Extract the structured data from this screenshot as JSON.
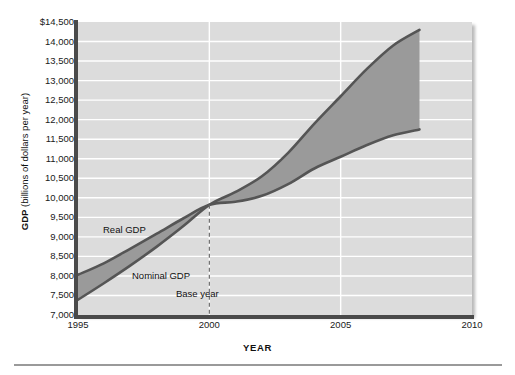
{
  "chart_data": {
    "type": "area",
    "title": "",
    "xlabel": "YEAR",
    "ylabel_bold": "GDP",
    "ylabel_rest": " (billions of dollars per year)",
    "xlim": [
      1995,
      2010
    ],
    "ylim": [
      7000,
      14500
    ],
    "grid": true,
    "legend_position": "inline-annotations",
    "xticks": [
      1995,
      2000,
      2005,
      2010
    ],
    "xtick_labels": [
      "1995",
      "2000",
      "2005",
      "2010"
    ],
    "yticks": [
      7000,
      7500,
      8000,
      8500,
      9000,
      9500,
      10000,
      10500,
      11000,
      11500,
      12000,
      12500,
      13000,
      13500,
      14000,
      14500
    ],
    "ytick_labels": [
      "7,000",
      "7,500",
      "8,000",
      "8,500",
      "9,000",
      "9,500",
      "10,000",
      "10,500",
      "11,000",
      "11,500",
      "12,000",
      "12,500",
      "13,000",
      "13,500",
      "14,000",
      "$14,500"
    ],
    "base_year": 2000,
    "base_year_label": "Base year",
    "x": [
      1995,
      1996,
      1997,
      1998,
      1999,
      2000,
      2001,
      2002,
      2003,
      2004,
      2005,
      2006,
      2007,
      2008
    ],
    "series": [
      {
        "name": "Real GDP",
        "label": "Real GDP",
        "color": "#9a9a9a",
        "line_color": "#555555",
        "values": [
          8030,
          8330,
          8700,
          9080,
          9470,
          9820,
          9900,
          10050,
          10350,
          10750,
          11050,
          11350,
          11600,
          11750
        ]
      },
      {
        "name": "Nominal GDP",
        "label": "Nominal GDP",
        "color": "#9a9a9a",
        "line_color": "#555555",
        "values": [
          7390,
          7820,
          8270,
          8750,
          9270,
          9820,
          10150,
          10550,
          11150,
          11900,
          12600,
          13300,
          13900,
          14300
        ]
      }
    ],
    "fill_between_label": "GDP deflator gap (nominal minus real)",
    "colors": {
      "panel_background": "#dcdcdc",
      "gridline": "#ffffff",
      "axis_spine": "#4a4a4a",
      "fill": "#9a9a9a",
      "curve": "#555555",
      "text": "#111111",
      "footer_rule": "#9a9a9a"
    }
  }
}
